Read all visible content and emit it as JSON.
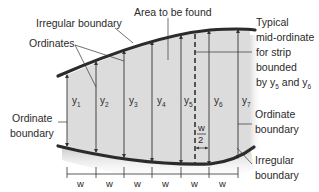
{
  "diagram": {
    "labels": {
      "area_to_be_found": "Area to be found",
      "irregular_boundary_top": "Irregular boundary",
      "ordinates": "Ordinates",
      "typical_mid_ordinate": [
        "Typical",
        "mid-ordinate",
        "for strip",
        "bounded",
        "by y"
      ],
      "typical_and": " and y",
      "sub5": "5",
      "sub6": "6",
      "ordinate_boundary_left": [
        "Ordinate",
        "boundary"
      ],
      "ordinate_boundary_right": [
        "Ordinate",
        "boundary"
      ],
      "irregular_boundary_bottom": [
        "Irregular",
        "boundary"
      ],
      "half_width_num": "w",
      "half_width_den": "2"
    },
    "ordinates": [
      {
        "name": "y",
        "sub": "1"
      },
      {
        "name": "y",
        "sub": "2"
      },
      {
        "name": "y",
        "sub": "3"
      },
      {
        "name": "y",
        "sub": "4"
      },
      {
        "name": "y",
        "sub": "5"
      },
      {
        "name": "y",
        "sub": "6"
      },
      {
        "name": "y",
        "sub": "7"
      }
    ],
    "strip_width_labels": [
      "w",
      "w",
      "w",
      "w",
      "w",
      "w"
    ],
    "colors": {
      "fill": "#d9d9d9",
      "boundary": "#2b2b2b",
      "line": "#333333",
      "text": "#2a2a2a"
    }
  }
}
